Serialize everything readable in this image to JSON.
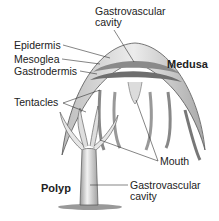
{
  "diagram": {
    "forms": {
      "medusa": "Medusa",
      "polyp": "Polyp"
    },
    "labels": {
      "gastrovascular_top_line1": "Gastrovascular",
      "gastrovascular_top_line2": "cavity",
      "epidermis": "Epidermis",
      "mesoglea": "Mesoglea",
      "gastrodermis": "Gastrodermis",
      "tentacles": "Tentacles",
      "mouth": "Mouth",
      "gastrovascular_bottom_line1": "Gastrovascular",
      "gastrovascular_bottom_line2": "cavity"
    },
    "colors": {
      "epidermis": "#d9d9d9",
      "mesoglea": "#8c8c8c",
      "gastrodermis": "#6e6e6e",
      "outline": "#444444",
      "label_line": "#333333"
    }
  }
}
